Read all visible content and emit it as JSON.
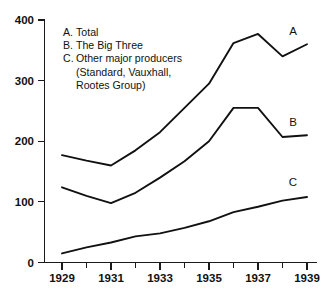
{
  "chart_data": {
    "type": "line",
    "title": "",
    "xlabel": "",
    "ylabel": "",
    "x": [
      1929,
      1930,
      1931,
      1932,
      1933,
      1934,
      1935,
      1936,
      1937,
      1938,
      1939
    ],
    "xlim": [
      1929,
      1939
    ],
    "ylim": [
      0,
      400
    ],
    "grid": false,
    "legend_position": "upper-left-inside",
    "y_ticks": [
      "0",
      "100",
      "200",
      "300",
      "400"
    ],
    "y_tick_values": [
      0,
      100,
      200,
      300,
      400
    ],
    "x_ticks": [
      "1929",
      "1931",
      "1933",
      "1935",
      "1937",
      "1939"
    ],
    "x_tick_values": [
      1929,
      1931,
      1933,
      1935,
      1937,
      1939
    ],
    "x_minor_tick_values": [
      1930,
      1932,
      1934,
      1936,
      1938
    ],
    "series": [
      {
        "key": "A",
        "name": "Total",
        "end_label": "A",
        "values": [
          177,
          168,
          160,
          185,
          215,
          255,
          295,
          362,
          377,
          340,
          360
        ]
      },
      {
        "key": "B",
        "name": "The Big Three",
        "end_label": "B",
        "values": [
          124,
          110,
          98,
          115,
          140,
          167,
          200,
          255,
          255,
          207,
          210
        ]
      },
      {
        "key": "C",
        "name": "Other major producers (Standard, Vauxhall, Rootes Group)",
        "end_label": "C",
        "values": [
          15,
          25,
          33,
          43,
          48,
          57,
          68,
          83,
          92,
          102,
          108
        ]
      }
    ]
  },
  "legend": {
    "entries": [
      {
        "key": "A.",
        "label": "Total",
        "continuation": []
      },
      {
        "key": "B.",
        "label": "The Big Three",
        "continuation": []
      },
      {
        "key": "C.",
        "label": "Other major producers",
        "continuation": [
          "(Standard, Vauxhall,",
          "Rootes Group)"
        ]
      }
    ]
  },
  "axes": {
    "y_labels": [
      "400",
      "300",
      "200",
      "100",
      "0"
    ],
    "x_labels": [
      "1929",
      "1931",
      "1933",
      "1935",
      "1937",
      "1939"
    ]
  },
  "curve_labels": {
    "a": "A",
    "b": "B",
    "c": "C"
  },
  "colors": {
    "ink": "#111111",
    "background": "#ffffff"
  }
}
